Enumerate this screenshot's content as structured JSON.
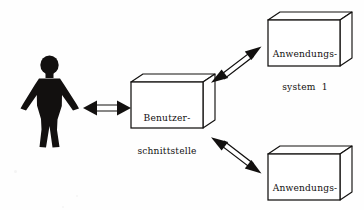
{
  "diagram": {
    "type": "block-diagram",
    "background_color": "#fefefe",
    "stroke_color": "#12100f",
    "fill_color": "#ffffff",
    "actor": {
      "name": "Benutzer",
      "shape": "human-silhouette",
      "fill_color": "#12100f"
    },
    "nodes": [
      {
        "id": "interface",
        "shape": "3d-box",
        "lines": [
          "Benutzer-",
          "schnittstelle"
        ]
      },
      {
        "id": "system-1",
        "shape": "3d-box",
        "lines": [
          "Anwendungs-",
          "system  1"
        ]
      },
      {
        "id": "system-2",
        "shape": "3d-box",
        "lines": [
          "Anwendungs-",
          "system  2"
        ]
      }
    ],
    "connectors": [
      {
        "id": "actor-to-interface",
        "from": "actor",
        "to": "interface",
        "style": "double-headed-hollow-arrow",
        "orientation": "horizontal"
      },
      {
        "id": "interface-to-system-1",
        "from": "interface",
        "to": "system-1",
        "style": "double-headed-hollow-arrow",
        "orientation": "diagonal-up-right"
      },
      {
        "id": "interface-to-system-2",
        "from": "interface",
        "to": "system-2",
        "style": "double-headed-hollow-arrow",
        "orientation": "diagonal-down-right"
      }
    ]
  }
}
